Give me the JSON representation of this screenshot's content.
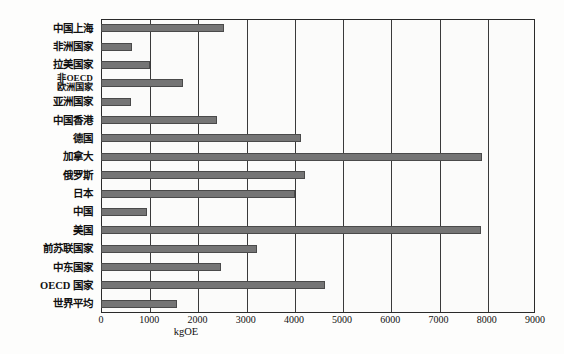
{
  "chart_data": {
    "type": "bar",
    "orientation": "horizontal",
    "title": "",
    "subtitle": "",
    "xlabel": "kgOE",
    "ylabel": "",
    "xlim": [
      0,
      9000
    ],
    "xticks": [
      0,
      1000,
      2000,
      3000,
      4000,
      5000,
      6000,
      7000,
      8000,
      9000
    ],
    "grid": "vertical",
    "legend": "none",
    "categories": [
      "中国上海",
      "非洲国家",
      "拉美国家",
      "非OECD\n欧洲国家",
      "亚洲国家",
      "中国香港",
      "德国",
      "加拿大",
      "俄罗斯",
      "日本",
      "中国",
      "美国",
      "前苏联国家",
      "中东国家",
      "OECD 国家",
      "世界平均"
    ],
    "values": [
      2560,
      640,
      1010,
      1700,
      620,
      2400,
      4150,
      7900,
      4230,
      4030,
      950,
      7880,
      3230,
      2480,
      4650,
      1580
    ],
    "bar_color": "#757575",
    "bar_border_color": "#4a4a4a",
    "frame_color": "#2a2a2a",
    "grid_color": "#3a3a3a",
    "background": "#fbfbfa"
  }
}
